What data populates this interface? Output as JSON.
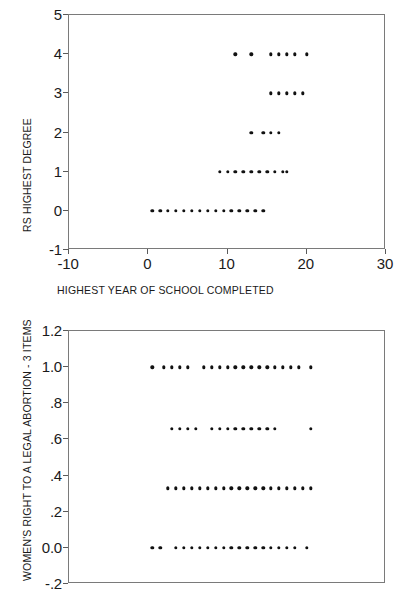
{
  "chart_data": [
    {
      "id": "degree-vs-education",
      "type": "scatter",
      "title": "",
      "xlabel": "HIGHEST YEAR OF SCHOOL COMPLETED",
      "ylabel": "RS HIGHEST DEGREE",
      "xlim": [
        -10,
        30
      ],
      "ylim": [
        -1,
        5
      ],
      "xticks": [
        -10,
        0,
        10,
        20,
        30
      ],
      "xticklabels": [
        "-10",
        "0",
        "10",
        "20",
        "30"
      ],
      "yticks": [
        -1,
        0,
        1,
        2,
        3,
        4,
        5
      ],
      "yticklabels": [
        "-1",
        "0",
        "1",
        "2",
        "3",
        "4",
        "5"
      ],
      "grid": false,
      "legend": false,
      "marker": "filled-circle",
      "marker_color": "#111111",
      "frame_color": "#7a7a7a",
      "points": [
        {
          "x": 0.5,
          "y": 0
        },
        {
          "x": 1.5,
          "y": 0
        },
        {
          "x": 2.5,
          "y": 0
        },
        {
          "x": 3.5,
          "y": 0
        },
        {
          "x": 4.5,
          "y": 0
        },
        {
          "x": 5.5,
          "y": 0
        },
        {
          "x": 6.5,
          "y": 0
        },
        {
          "x": 7.5,
          "y": 0
        },
        {
          "x": 8.5,
          "y": 0
        },
        {
          "x": 9.5,
          "y": 0
        },
        {
          "x": 10.5,
          "y": 0
        },
        {
          "x": 11.5,
          "y": 0
        },
        {
          "x": 12.5,
          "y": 0
        },
        {
          "x": 13.5,
          "y": 0
        },
        {
          "x": 14.5,
          "y": 0
        },
        {
          "x": 9.0,
          "y": 1
        },
        {
          "x": 10.0,
          "y": 1
        },
        {
          "x": 11.0,
          "y": 1
        },
        {
          "x": 12.0,
          "y": 1
        },
        {
          "x": 13.0,
          "y": 1
        },
        {
          "x": 14.0,
          "y": 1
        },
        {
          "x": 15.0,
          "y": 1
        },
        {
          "x": 16.0,
          "y": 1
        },
        {
          "x": 17.0,
          "y": 1
        },
        {
          "x": 17.5,
          "y": 1
        },
        {
          "x": 13.0,
          "y": 2
        },
        {
          "x": 14.5,
          "y": 2
        },
        {
          "x": 15.5,
          "y": 2
        },
        {
          "x": 16.5,
          "y": 2
        },
        {
          "x": 15.5,
          "y": 3
        },
        {
          "x": 16.5,
          "y": 3
        },
        {
          "x": 17.5,
          "y": 3
        },
        {
          "x": 18.5,
          "y": 3
        },
        {
          "x": 19.5,
          "y": 3
        },
        {
          "x": 11.0,
          "y": 4
        },
        {
          "x": 13.0,
          "y": 4
        },
        {
          "x": 15.5,
          "y": 4
        },
        {
          "x": 16.5,
          "y": 4
        },
        {
          "x": 17.5,
          "y": 4
        },
        {
          "x": 18.5,
          "y": 4
        },
        {
          "x": 20.0,
          "y": 4
        }
      ]
    },
    {
      "id": "abortion-rights-vs-education",
      "type": "scatter",
      "title": "",
      "xlabel": "",
      "ylabel": "WOMEN'S RIGHT TO A LEGAL ABORTION - 3 ITEMS",
      "xlim": [
        -10,
        30
      ],
      "ylim": [
        -0.2,
        1.2
      ],
      "xticks": [
        -10,
        0,
        10,
        20,
        30
      ],
      "xticklabels": [
        "-10",
        "0",
        "10",
        "20",
        "30"
      ],
      "yticks": [
        -0.2,
        0.0,
        0.2,
        0.4,
        0.6,
        0.8,
        1.0,
        1.2
      ],
      "yticklabels": [
        "-.2",
        "0.0",
        ".2",
        ".4",
        ".6",
        ".8",
        "1.0",
        "1.2"
      ],
      "grid": false,
      "legend": false,
      "marker": "filled-circle",
      "marker_color": "#111111",
      "frame_color": "#7a7a7a",
      "points": [
        {
          "x": 0.5,
          "y": 1.0
        },
        {
          "x": 2.0,
          "y": 1.0
        },
        {
          "x": 3.0,
          "y": 1.0
        },
        {
          "x": 4.0,
          "y": 1.0
        },
        {
          "x": 5.0,
          "y": 1.0
        },
        {
          "x": 7.0,
          "y": 1.0
        },
        {
          "x": 8.0,
          "y": 1.0
        },
        {
          "x": 9.0,
          "y": 1.0
        },
        {
          "x": 10.0,
          "y": 1.0
        },
        {
          "x": 11.0,
          "y": 1.0
        },
        {
          "x": 12.0,
          "y": 1.0
        },
        {
          "x": 13.0,
          "y": 1.0
        },
        {
          "x": 14.0,
          "y": 1.0
        },
        {
          "x": 15.0,
          "y": 1.0
        },
        {
          "x": 16.0,
          "y": 1.0
        },
        {
          "x": 17.0,
          "y": 1.0
        },
        {
          "x": 18.0,
          "y": 1.0
        },
        {
          "x": 19.0,
          "y": 1.0
        },
        {
          "x": 20.5,
          "y": 1.0
        },
        {
          "x": 3.0,
          "y": 0.66
        },
        {
          "x": 4.0,
          "y": 0.66
        },
        {
          "x": 5.0,
          "y": 0.66
        },
        {
          "x": 6.0,
          "y": 0.66
        },
        {
          "x": 8.0,
          "y": 0.66
        },
        {
          "x": 9.0,
          "y": 0.66
        },
        {
          "x": 10.0,
          "y": 0.66
        },
        {
          "x": 11.0,
          "y": 0.66
        },
        {
          "x": 12.0,
          "y": 0.66
        },
        {
          "x": 13.0,
          "y": 0.66
        },
        {
          "x": 14.0,
          "y": 0.66
        },
        {
          "x": 15.0,
          "y": 0.66
        },
        {
          "x": 16.0,
          "y": 0.66
        },
        {
          "x": 20.5,
          "y": 0.66
        },
        {
          "x": 2.5,
          "y": 0.33
        },
        {
          "x": 3.5,
          "y": 0.33
        },
        {
          "x": 4.5,
          "y": 0.33
        },
        {
          "x": 5.5,
          "y": 0.33
        },
        {
          "x": 6.5,
          "y": 0.33
        },
        {
          "x": 7.5,
          "y": 0.33
        },
        {
          "x": 8.5,
          "y": 0.33
        },
        {
          "x": 9.5,
          "y": 0.33
        },
        {
          "x": 10.5,
          "y": 0.33
        },
        {
          "x": 11.5,
          "y": 0.33
        },
        {
          "x": 12.5,
          "y": 0.33
        },
        {
          "x": 13.5,
          "y": 0.33
        },
        {
          "x": 14.5,
          "y": 0.33
        },
        {
          "x": 15.5,
          "y": 0.33
        },
        {
          "x": 16.5,
          "y": 0.33
        },
        {
          "x": 17.5,
          "y": 0.33
        },
        {
          "x": 18.5,
          "y": 0.33
        },
        {
          "x": 19.5,
          "y": 0.33
        },
        {
          "x": 20.5,
          "y": 0.33
        },
        {
          "x": 0.5,
          "y": 0.0
        },
        {
          "x": 1.5,
          "y": 0.0
        },
        {
          "x": 3.5,
          "y": 0.0
        },
        {
          "x": 4.5,
          "y": 0.0
        },
        {
          "x": 5.5,
          "y": 0.0
        },
        {
          "x": 6.5,
          "y": 0.0
        },
        {
          "x": 7.5,
          "y": 0.0
        },
        {
          "x": 8.5,
          "y": 0.0
        },
        {
          "x": 9.5,
          "y": 0.0
        },
        {
          "x": 10.5,
          "y": 0.0
        },
        {
          "x": 11.5,
          "y": 0.0
        },
        {
          "x": 12.5,
          "y": 0.0
        },
        {
          "x": 13.5,
          "y": 0.0
        },
        {
          "x": 14.5,
          "y": 0.0
        },
        {
          "x": 15.5,
          "y": 0.0
        },
        {
          "x": 16.5,
          "y": 0.0
        },
        {
          "x": 17.5,
          "y": 0.0
        },
        {
          "x": 18.5,
          "y": 0.0
        },
        {
          "x": 20.0,
          "y": 0.0
        }
      ]
    }
  ],
  "charts": {
    "top": {
      "ylabel": "RS HIGHEST DEGREE",
      "xlabel": "HIGHEST YEAR OF SCHOOL COMPLETED"
    },
    "bottom": {
      "ylabel": "WOMEN'S RIGHT TO A LEGAL ABORTION - 3 ITEMS"
    }
  }
}
